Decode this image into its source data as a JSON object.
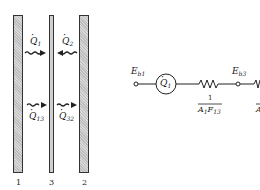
{
  "figure": {
    "plates": [
      {
        "id": "1",
        "label": "1"
      },
      {
        "id": "3",
        "label": "3"
      },
      {
        "id": "2",
        "label": "2"
      }
    ],
    "arrows": {
      "q1": {
        "symbol": "Q",
        "sub": "1",
        "direction": "right"
      },
      "q2": {
        "symbol": "Q",
        "sub": "2",
        "direction": "left"
      },
      "q13": {
        "symbol": "Q",
        "sub": "13",
        "direction": "right"
      },
      "q32": {
        "symbol": "Q",
        "sub": "32",
        "direction": "right"
      }
    }
  },
  "circuit": {
    "node_eb1": {
      "symbol": "E",
      "sub": "b1"
    },
    "source": {
      "symbol": "Q",
      "sub": "1"
    },
    "resistor1": {
      "numerator": "1",
      "den_a": "A",
      "den_a_sub": "1",
      "den_f": "F",
      "den_f_sub": "13"
    },
    "node_eb3": {
      "symbol": "E",
      "sub": "b3"
    },
    "resistor2_partial": {
      "den_a": "A"
    }
  }
}
